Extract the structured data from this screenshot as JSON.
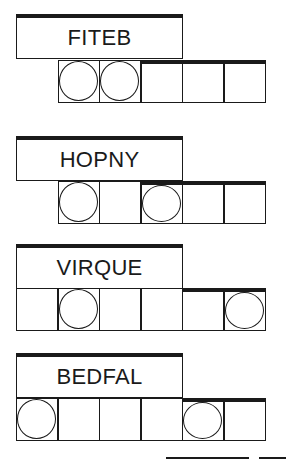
{
  "puzzles": [
    {
      "scrambled": "FITEB",
      "cells": 6,
      "start_cell": 1,
      "circled": [
        0,
        1
      ],
      "tail_start": 3
    },
    {
      "scrambled": "HOPNY",
      "cells": 6,
      "start_cell": 1,
      "circled": [
        0,
        2
      ],
      "tail_start": 3
    },
    {
      "scrambled": "VIRQUE",
      "cells": 6,
      "start_cell": 0,
      "circled": [
        1,
        5
      ],
      "tail_start": 4
    },
    {
      "scrambled": "BEDFAL",
      "cells": 6,
      "start_cell": 0,
      "circled": [
        0,
        4
      ],
      "tail_start": 4
    }
  ],
  "answer_blanks": 2
}
